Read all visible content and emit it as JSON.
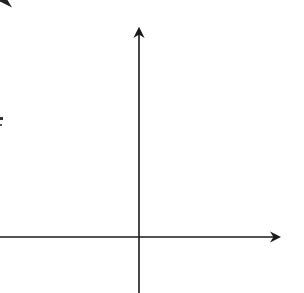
{
  "panel_label": "II",
  "chart_data": {
    "type": "line",
    "xlabel": "x",
    "ylabel": "y",
    "xlim": [
      -6,
      6
    ],
    "ylim": [
      -2.8,
      9
    ],
    "grid": true,
    "grid_step": 1,
    "major_grid_step": 5,
    "tick_labels": {
      "x": [
        "5"
      ],
      "y": [
        "5"
      ]
    },
    "series": [
      {
        "name": "line",
        "equation": "y = 2x + 5",
        "slope": 2,
        "intercept": 5,
        "arrows": "both",
        "x": [
          -3.9,
          2
        ],
        "y": [
          -2.8,
          9
        ],
        "color": "#222222"
      }
    ],
    "x_intercept": -2.5,
    "y_intercept": 5
  },
  "colors": {
    "grid": "#c4c4c4",
    "grid_major": "#8a8a8a",
    "axis": "#1a1a1a",
    "line": "#222222"
  }
}
